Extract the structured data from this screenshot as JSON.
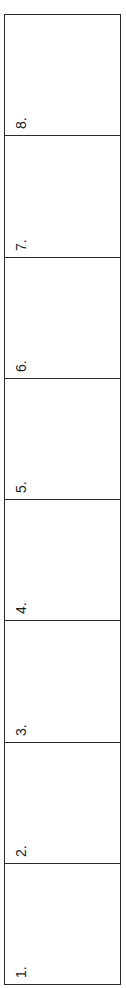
{
  "form": {
    "border_color": "#2a2a2a",
    "cells": [
      {
        "label": "8."
      },
      {
        "label": "7."
      },
      {
        "label": "6."
      },
      {
        "label": "5."
      },
      {
        "label": "4."
      },
      {
        "label": "3."
      },
      {
        "label": "2."
      },
      {
        "label": "1."
      }
    ]
  }
}
